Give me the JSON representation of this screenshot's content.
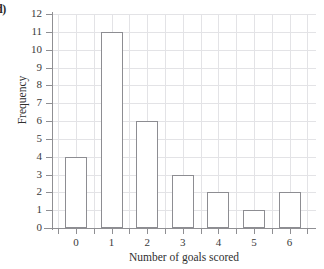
{
  "part_label": "d)",
  "chart_data": {
    "type": "bar",
    "title": "",
    "xlabel": "Number of goals scored",
    "ylabel": "Frequency",
    "categories": [
      "0",
      "1",
      "2",
      "3",
      "4",
      "5",
      "6"
    ],
    "values": [
      4,
      11,
      6,
      3,
      2,
      1,
      2
    ],
    "ylim": [
      0,
      12
    ],
    "y_ticks": [
      "0",
      "1",
      "2",
      "3",
      "4",
      "5",
      "6",
      "7",
      "8",
      "9",
      "10",
      "11",
      "12"
    ],
    "x_ticks": [
      "0",
      "1",
      "2",
      "3",
      "4",
      "5",
      "6"
    ],
    "grid": true,
    "legend": null,
    "bar_fill": "#ffffff",
    "bar_edge": "#8d8d92",
    "grid_color": "#e3e3e6",
    "axis_color": "#8f8f93"
  }
}
